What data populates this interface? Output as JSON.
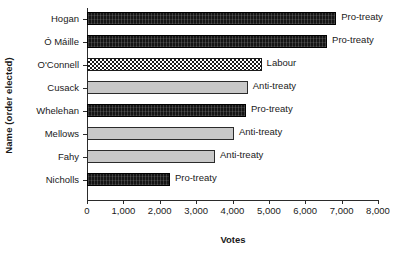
{
  "chart_data": {
    "type": "bar",
    "orientation": "horizontal",
    "title": "",
    "xlabel": "Votes",
    "ylabel": "Name (order elected)",
    "categories": [
      "Hogan",
      "Ó Máille",
      "O'Connell",
      "Cusack",
      "Whelehan",
      "Mellows",
      "Fahy",
      "Nicholls"
    ],
    "values": [
      6850,
      6600,
      4800,
      4420,
      4370,
      4040,
      3520,
      2280
    ],
    "annotations": [
      "Pro-treaty",
      "Pro-treaty",
      "Labour",
      "Anti-treaty",
      "Pro-treaty",
      "Anti-treaty",
      "Anti-treaty",
      "Pro-treaty"
    ],
    "series": [
      {
        "name": "Votes",
        "points": [
          {
            "label": "Hogan",
            "value": 6850,
            "group": "Pro-treaty",
            "fill": "solid-black"
          },
          {
            "label": "Ó Máille",
            "value": 6600,
            "group": "Pro-treaty",
            "fill": "solid-black"
          },
          {
            "label": "O'Connell",
            "value": 4800,
            "group": "Labour",
            "fill": "checkerboard"
          },
          {
            "label": "Cusack",
            "value": 4420,
            "group": "Anti-treaty",
            "fill": "light-gray"
          },
          {
            "label": "Whelehan",
            "value": 4370,
            "group": "Pro-treaty",
            "fill": "solid-black"
          },
          {
            "label": "Mellows",
            "value": 4040,
            "group": "Anti-treaty",
            "fill": "light-gray"
          },
          {
            "label": "Fahy",
            "value": 3520,
            "group": "Anti-treaty",
            "fill": "light-gray"
          },
          {
            "label": "Nicholls",
            "value": 2280,
            "group": "Pro-treaty",
            "fill": "solid-black"
          }
        ]
      }
    ],
    "xlim": [
      0,
      8000
    ],
    "xticks": [
      0,
      1000,
      2000,
      3000,
      4000,
      5000,
      6000,
      7000,
      8000
    ],
    "xtick_labels": [
      "0",
      "1,000",
      "2,000",
      "3,000",
      "4,000",
      "5,000",
      "6,000",
      "7,000",
      "8,000"
    ],
    "grid": false,
    "legend": "none (inline bar annotations)",
    "colors": {
      "pro_treaty": "#151515",
      "anti_treaty": "#c8c8c8",
      "labour": "#1a1a1a",
      "axis": "#2b2b2b",
      "background": "#ffffff",
      "text": "#1a1a1a"
    }
  }
}
